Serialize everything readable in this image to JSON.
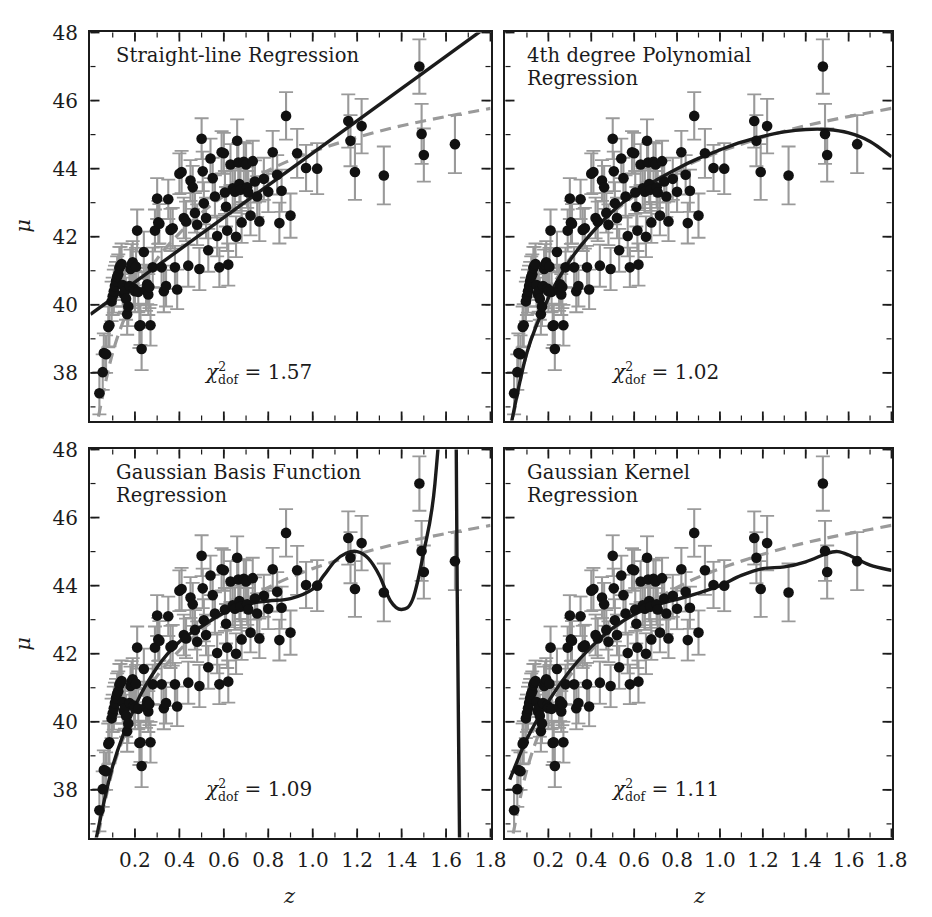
{
  "figure": {
    "width": 932,
    "height": 917,
    "background": "#ffffff",
    "x_axis_label": "z",
    "y_axis_label": "μ",
    "point_color": "#111111",
    "errorbar_color": "#9a9a9a",
    "fit_color": "#1b1b1b",
    "truth_color": "#9a9a9a",
    "frame_color": "#1b1b1b"
  },
  "chart_data": {
    "type": "scatter",
    "title": "",
    "xlabel": "z",
    "ylabel": "μ",
    "xlim": [
      0.0,
      1.8
    ],
    "ylim": [
      36.6,
      48.0
    ],
    "xticks": [
      0.2,
      0.4,
      0.6,
      0.8,
      1.0,
      1.2,
      1.4,
      1.6,
      1.8
    ],
    "xticklabels": [
      "0.2",
      "0.4",
      "0.6",
      "0.8",
      "1.0",
      "1.2",
      "1.4",
      "1.6",
      "1.8"
    ],
    "yticks": [
      38,
      40,
      42,
      44,
      46,
      48
    ],
    "yticklabels": [
      "38",
      "40",
      "42",
      "44",
      "46",
      "48"
    ],
    "grid": false,
    "legend": "none",
    "panels": [
      {
        "id": "straight-line",
        "title": "Straight-line Regression",
        "chi2_label": "χ",
        "chi2_sup": "2",
        "chi2_sub": "dof",
        "chi2_value": "= 1.57",
        "chi2_number": 1.57,
        "fit_kind": "linear",
        "fit_x": [
          0.0,
          1.8
        ],
        "fit_y": [
          39.72,
          48.25
        ]
      },
      {
        "id": "poly4",
        "title": "4th degree Polynomial\nRegression",
        "chi2_label": "χ",
        "chi2_sup": "2",
        "chi2_sub": "dof",
        "chi2_value": "= 1.02",
        "chi2_number": 1.02,
        "fit_kind": "poly4",
        "fit_x": [
          0.02,
          0.1,
          0.2,
          0.3,
          0.4,
          0.5,
          0.6,
          0.7,
          0.8,
          0.9,
          1.0,
          1.1,
          1.2,
          1.3,
          1.4,
          1.5,
          1.6,
          1.7,
          1.8
        ],
        "fit_y": [
          36.3,
          38.6,
          40.2,
          41.3,
          42.1,
          42.75,
          43.25,
          43.65,
          44.0,
          44.3,
          44.55,
          44.78,
          44.95,
          45.08,
          45.15,
          45.15,
          45.05,
          44.8,
          44.35
        ]
      },
      {
        "id": "gaussian-basis",
        "title": "Gaussian Basis Function\nRegression",
        "chi2_label": "χ",
        "chi2_sup": "2",
        "chi2_sub": "dof",
        "chi2_value": "= 1.09",
        "chi2_number": 1.09,
        "fit_kind": "gaussian-basis",
        "fit_x": [
          0.02,
          0.1,
          0.2,
          0.3,
          0.4,
          0.5,
          0.6,
          0.7,
          0.8,
          0.9,
          1.0,
          1.05,
          1.1,
          1.15,
          1.2,
          1.25,
          1.3,
          1.35,
          1.4,
          1.45,
          1.5,
          1.55,
          1.6,
          1.63,
          1.65,
          1.67,
          1.7,
          1.75,
          1.8
        ],
        "fit_y": [
          36.4,
          38.7,
          40.45,
          41.6,
          42.35,
          42.8,
          43.2,
          43.45,
          43.55,
          43.62,
          43.9,
          44.3,
          44.72,
          44.95,
          45.0,
          44.8,
          44.3,
          43.55,
          43.3,
          43.6,
          45.0,
          47.0,
          52.0,
          60.0,
          44.0,
          30.0,
          18.0,
          10.0,
          8.0
        ]
      },
      {
        "id": "gaussian-kernel",
        "title": "Gaussian Kernel\nRegression",
        "chi2_label": "χ",
        "chi2_sup": "2",
        "chi2_sub": "dof",
        "chi2_value": "= 1.11",
        "chi2_number": 1.11,
        "fit_kind": "gaussian-kernel",
        "fit_x": [
          0.02,
          0.1,
          0.2,
          0.3,
          0.4,
          0.5,
          0.6,
          0.7,
          0.8,
          0.9,
          1.0,
          1.1,
          1.2,
          1.3,
          1.4,
          1.5,
          1.55,
          1.6,
          1.7,
          1.8
        ],
        "fit_y": [
          38.3,
          39.5,
          40.6,
          41.5,
          42.2,
          42.75,
          43.15,
          43.42,
          43.6,
          43.78,
          44.0,
          44.3,
          44.5,
          44.55,
          44.7,
          44.95,
          45.0,
          44.9,
          44.6,
          44.45
        ]
      }
    ],
    "truth_curve": {
      "name": "cosmology truth (dashed)",
      "x": [
        0.02,
        0.1,
        0.2,
        0.3,
        0.4,
        0.5,
        0.6,
        0.7,
        0.8,
        0.9,
        1.0,
        1.1,
        1.2,
        1.3,
        1.4,
        1.5,
        1.6,
        1.7,
        1.8
      ],
      "y": [
        36.2,
        38.6,
        40.3,
        41.35,
        42.1,
        42.7,
        43.2,
        43.6,
        43.95,
        44.25,
        44.5,
        44.72,
        44.92,
        45.1,
        45.26,
        45.4,
        45.53,
        45.65,
        45.77
      ]
    },
    "points": [
      {
        "z": 0.04,
        "mu": 37.4,
        "err": 0.62
      },
      {
        "z": 0.055,
        "mu": 38.02,
        "err": 0.52
      },
      {
        "z": 0.06,
        "mu": 38.58,
        "err": 0.58
      },
      {
        "z": 0.07,
        "mu": 38.55,
        "err": 0.55
      },
      {
        "z": 0.08,
        "mu": 39.35,
        "err": 0.6
      },
      {
        "z": 0.085,
        "mu": 39.4,
        "err": 0.62
      },
      {
        "z": 0.095,
        "mu": 40.1,
        "err": 0.58
      },
      {
        "z": 0.1,
        "mu": 40.25,
        "err": 0.55
      },
      {
        "z": 0.105,
        "mu": 40.4,
        "err": 0.63
      },
      {
        "z": 0.11,
        "mu": 40.55,
        "err": 0.6
      },
      {
        "z": 0.115,
        "mu": 40.7,
        "err": 0.56
      },
      {
        "z": 0.12,
        "mu": 40.82,
        "err": 0.6
      },
      {
        "z": 0.125,
        "mu": 40.9,
        "err": 0.58
      },
      {
        "z": 0.13,
        "mu": 41.08,
        "err": 0.62
      },
      {
        "z": 0.135,
        "mu": 41.15,
        "err": 0.55
      },
      {
        "z": 0.14,
        "mu": 41.2,
        "err": 0.6
      },
      {
        "z": 0.145,
        "mu": 40.58,
        "err": 0.63
      },
      {
        "z": 0.15,
        "mu": 40.32,
        "err": 0.58
      },
      {
        "z": 0.155,
        "mu": 40.4,
        "err": 0.6
      },
      {
        "z": 0.16,
        "mu": 40.18,
        "err": 0.62
      },
      {
        "z": 0.165,
        "mu": 39.72,
        "err": 0.6
      },
      {
        "z": 0.17,
        "mu": 39.95,
        "err": 0.58
      },
      {
        "z": 0.175,
        "mu": 40.55,
        "err": 0.61
      },
      {
        "z": 0.18,
        "mu": 41.05,
        "err": 0.57
      },
      {
        "z": 0.185,
        "mu": 41.18,
        "err": 0.6
      },
      {
        "z": 0.19,
        "mu": 41.25,
        "err": 0.62
      },
      {
        "z": 0.195,
        "mu": 40.48,
        "err": 0.58
      },
      {
        "z": 0.2,
        "mu": 40.4,
        "err": 0.6
      },
      {
        "z": 0.205,
        "mu": 41.12,
        "err": 0.55
      },
      {
        "z": 0.21,
        "mu": 42.18,
        "err": 0.62
      },
      {
        "z": 0.215,
        "mu": 40.38,
        "err": 0.6
      },
      {
        "z": 0.22,
        "mu": 39.38,
        "err": 0.65
      },
      {
        "z": 0.225,
        "mu": 39.4,
        "err": 0.58
      },
      {
        "z": 0.23,
        "mu": 38.7,
        "err": 0.62
      },
      {
        "z": 0.24,
        "mu": 41.55,
        "err": 0.6
      },
      {
        "z": 0.25,
        "mu": 40.45,
        "err": 0.63
      },
      {
        "z": 0.255,
        "mu": 40.6,
        "err": 0.58
      },
      {
        "z": 0.26,
        "mu": 40.3,
        "err": 0.6
      },
      {
        "z": 0.265,
        "mu": 40.52,
        "err": 0.62
      },
      {
        "z": 0.27,
        "mu": 39.4,
        "err": 0.6
      },
      {
        "z": 0.28,
        "mu": 41.1,
        "err": 0.58
      },
      {
        "z": 0.29,
        "mu": 42.18,
        "err": 0.62
      },
      {
        "z": 0.3,
        "mu": 43.12,
        "err": 0.6
      },
      {
        "z": 0.305,
        "mu": 42.42,
        "err": 0.63
      },
      {
        "z": 0.31,
        "mu": 42.38,
        "err": 0.58
      },
      {
        "z": 0.32,
        "mu": 41.1,
        "err": 0.6
      },
      {
        "z": 0.33,
        "mu": 40.4,
        "err": 0.62
      },
      {
        "z": 0.34,
        "mu": 40.55,
        "err": 0.6
      },
      {
        "z": 0.35,
        "mu": 43.1,
        "err": 0.58
      },
      {
        "z": 0.36,
        "mu": 42.2,
        "err": 0.62
      },
      {
        "z": 0.37,
        "mu": 42.25,
        "err": 0.6
      },
      {
        "z": 0.38,
        "mu": 41.1,
        "err": 0.63
      },
      {
        "z": 0.39,
        "mu": 40.45,
        "err": 0.58
      },
      {
        "z": 0.4,
        "mu": 43.85,
        "err": 0.6
      },
      {
        "z": 0.41,
        "mu": 43.9,
        "err": 0.62
      },
      {
        "z": 0.42,
        "mu": 42.55,
        "err": 0.6
      },
      {
        "z": 0.43,
        "mu": 42.45,
        "err": 0.58
      },
      {
        "z": 0.44,
        "mu": 41.15,
        "err": 0.62
      },
      {
        "z": 0.45,
        "mu": 43.65,
        "err": 0.6
      },
      {
        "z": 0.46,
        "mu": 43.45,
        "err": 0.63
      },
      {
        "z": 0.47,
        "mu": 42.7,
        "err": 0.58
      },
      {
        "z": 0.48,
        "mu": 42.35,
        "err": 0.6
      },
      {
        "z": 0.49,
        "mu": 41.05,
        "err": 0.62
      },
      {
        "z": 0.5,
        "mu": 44.88,
        "err": 0.6
      },
      {
        "z": 0.505,
        "mu": 43.92,
        "err": 0.58
      },
      {
        "z": 0.51,
        "mu": 42.98,
        "err": 0.62
      },
      {
        "z": 0.52,
        "mu": 42.55,
        "err": 0.6
      },
      {
        "z": 0.53,
        "mu": 41.6,
        "err": 0.63
      },
      {
        "z": 0.54,
        "mu": 44.3,
        "err": 0.58
      },
      {
        "z": 0.55,
        "mu": 43.72,
        "err": 0.6
      },
      {
        "z": 0.56,
        "mu": 43.18,
        "err": 0.62
      },
      {
        "z": 0.57,
        "mu": 42.02,
        "err": 0.6
      },
      {
        "z": 0.58,
        "mu": 41.1,
        "err": 0.58
      },
      {
        "z": 0.59,
        "mu": 44.48,
        "err": 0.62
      },
      {
        "z": 0.6,
        "mu": 44.45,
        "err": 0.6
      },
      {
        "z": 0.605,
        "mu": 43.3,
        "err": 0.63
      },
      {
        "z": 0.61,
        "mu": 42.88,
        "err": 0.58
      },
      {
        "z": 0.615,
        "mu": 42.18,
        "err": 0.6
      },
      {
        "z": 0.62,
        "mu": 41.18,
        "err": 0.62
      },
      {
        "z": 0.63,
        "mu": 44.12,
        "err": 0.6
      },
      {
        "z": 0.64,
        "mu": 43.42,
        "err": 0.58
      },
      {
        "z": 0.65,
        "mu": 43.32,
        "err": 0.62
      },
      {
        "z": 0.655,
        "mu": 42.0,
        "err": 0.6
      },
      {
        "z": 0.66,
        "mu": 44.82,
        "err": 0.63
      },
      {
        "z": 0.665,
        "mu": 44.18,
        "err": 0.58
      },
      {
        "z": 0.67,
        "mu": 43.55,
        "err": 0.6
      },
      {
        "z": 0.675,
        "mu": 43.38,
        "err": 0.62
      },
      {
        "z": 0.68,
        "mu": 42.42,
        "err": 0.6
      },
      {
        "z": 0.69,
        "mu": 44.2,
        "err": 0.58
      },
      {
        "z": 0.7,
        "mu": 44.12,
        "err": 0.62
      },
      {
        "z": 0.705,
        "mu": 43.45,
        "err": 0.6
      },
      {
        "z": 0.71,
        "mu": 43.3,
        "err": 0.63
      },
      {
        "z": 0.72,
        "mu": 42.62,
        "err": 0.58
      },
      {
        "z": 0.73,
        "mu": 44.22,
        "err": 0.6
      },
      {
        "z": 0.74,
        "mu": 43.62,
        "err": 0.62
      },
      {
        "z": 0.75,
        "mu": 43.18,
        "err": 0.6
      },
      {
        "z": 0.76,
        "mu": 42.45,
        "err": 0.58
      },
      {
        "z": 0.78,
        "mu": 43.7,
        "err": 0.62
      },
      {
        "z": 0.8,
        "mu": 43.32,
        "err": 0.6
      },
      {
        "z": 0.82,
        "mu": 44.48,
        "err": 0.63
      },
      {
        "z": 0.84,
        "mu": 43.82,
        "err": 0.58
      },
      {
        "z": 0.85,
        "mu": 42.4,
        "err": 0.6
      },
      {
        "z": 0.86,
        "mu": 43.35,
        "err": 0.62
      },
      {
        "z": 0.88,
        "mu": 45.55,
        "err": 0.7
      },
      {
        "z": 0.9,
        "mu": 42.62,
        "err": 0.65
      },
      {
        "z": 0.93,
        "mu": 44.45,
        "err": 0.72
      },
      {
        "z": 0.97,
        "mu": 44.02,
        "err": 0.68
      },
      {
        "z": 1.02,
        "mu": 44.0,
        "err": 0.75
      },
      {
        "z": 1.16,
        "mu": 45.4,
        "err": 0.78
      },
      {
        "z": 1.17,
        "mu": 44.82,
        "err": 0.75
      },
      {
        "z": 1.19,
        "mu": 43.9,
        "err": 0.82
      },
      {
        "z": 1.22,
        "mu": 45.25,
        "err": 0.8
      },
      {
        "z": 1.32,
        "mu": 43.8,
        "err": 0.85
      },
      {
        "z": 1.48,
        "mu": 47.0,
        "err": 0.8
      },
      {
        "z": 1.49,
        "mu": 45.02,
        "err": 0.88
      },
      {
        "z": 1.5,
        "mu": 44.4,
        "err": 0.78
      },
      {
        "z": 1.64,
        "mu": 44.72,
        "err": 0.85
      }
    ]
  },
  "panel_titles": {
    "p0": "Straight-line Regression",
    "p1": "4th degree Polynomial\nRegression",
    "p2": "Gaussian Basis Function\nRegression",
    "p3": "Gaussian Kernel\nRegression"
  },
  "annotations": {
    "chi0": "= 1.57",
    "chi1": "= 1.02",
    "chi2": "= 1.09",
    "chi3": "= 1.11",
    "chi_symbol": "χ",
    "chi_sup": "2",
    "chi_sub": "dof"
  },
  "axes": {
    "x_label": "z",
    "y_label": "μ",
    "x_ticklabels": [
      "0.2",
      "0.4",
      "0.6",
      "0.8",
      "1.0",
      "1.2",
      "1.4",
      "1.6",
      "1.8"
    ],
    "y_ticklabels": [
      "38",
      "40",
      "42",
      "44",
      "46",
      "48"
    ]
  }
}
